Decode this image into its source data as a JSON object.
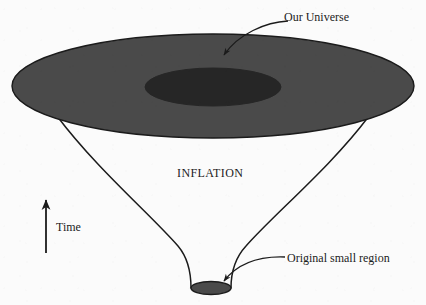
{
  "figure": {
    "background_color": "#fbfbfb",
    "line_color": "#1b1b1b",
    "text_color": "#1b1b1b"
  },
  "labels": {
    "our_universe": "Our Universe",
    "inflation": "INFLATION",
    "time": "Time",
    "original_small_region": "Original small region"
  },
  "shapes": {
    "outer_disk": {
      "name": "our-universe-disk",
      "fill": "#4a4a4a",
      "stroke": "#1b1b1b",
      "cx": 213,
      "cy": 86,
      "rx": 201,
      "ry": 52
    },
    "inner_disk": {
      "name": "observable-region-disk",
      "fill": "#2a2a2a",
      "stroke": "#2a2a2a",
      "cx": 213,
      "cy": 87,
      "rx": 68,
      "ry": 19
    },
    "bottom_disk": {
      "name": "original-small-region-disk",
      "fill": "#4a4a4a",
      "stroke": "#1b1b1b",
      "cx": 211,
      "cy": 288,
      "rx": 20,
      "ry": 6
    },
    "funnel_left_edge": {
      "name": "funnel-left-edge",
      "from": [
        57,
        116
      ],
      "to": [
        191,
        288
      ]
    },
    "funnel_right_edge": {
      "name": "funnel-right-edge",
      "from": [
        369,
        116
      ],
      "to": [
        231,
        288
      ]
    }
  },
  "annotations": [
    {
      "name": "our-universe-arrow",
      "target": "inner-disk",
      "from": [
        288,
        21
      ],
      "to": [
        222,
        58
      ]
    },
    {
      "name": "original-small-region-arrow",
      "target": "bottom-disk",
      "from": [
        285,
        257
      ],
      "to": [
        221,
        284
      ]
    },
    {
      "name": "time-arrow",
      "direction": "up",
      "from": [
        46,
        253
      ],
      "to": [
        46,
        196
      ]
    }
  ]
}
